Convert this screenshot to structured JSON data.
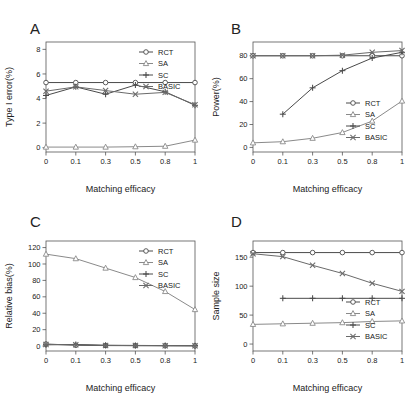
{
  "figure": {
    "background": "#ffffff",
    "width": 413,
    "height": 397,
    "series_colors": {
      "RCT": "#4a4a4a",
      "SA": "#8a8a8a",
      "SC": "#4a4a4a",
      "BASIC": "#6a6a6a"
    }
  },
  "panels": {
    "A": {
      "letter": "A"
    },
    "B": {
      "letter": "B"
    },
    "C": {
      "letter": "C"
    },
    "D": {
      "letter": "D"
    }
  },
  "legend": {
    "entries": [
      {
        "label": "RCT",
        "marker": "circle-icon",
        "color": "#4a4a4a"
      },
      {
        "label": "SA",
        "marker": "triangle-icon",
        "color": "#8a8a8a"
      },
      {
        "label": "SC",
        "marker": "plus-icon",
        "color": "#4a4a4a"
      },
      {
        "label": "BASIC",
        "marker": "cross-icon",
        "color": "#6a6a6a"
      }
    ]
  },
  "chart_data": [
    {
      "type": "line",
      "panel": "A",
      "title": "",
      "xlabel": "Matching efficacy",
      "ylabel": "Type I error(%)",
      "x": [
        0,
        0.1,
        0.3,
        0.5,
        0.8,
        1
      ],
      "xtick_labels": [
        "0",
        "0.1",
        "0.3",
        "0.5",
        "0.8",
        "1"
      ],
      "ytick_labels": [
        "0",
        "2",
        "4",
        "6",
        "8"
      ],
      "yticks": [
        0,
        2,
        4,
        6,
        8
      ],
      "ylim": [
        -0.35,
        8.6
      ],
      "grid": false,
      "legend_position": "top-right",
      "series": [
        {
          "name": "RCT",
          "marker": "circle",
          "values": [
            5.3,
            5.3,
            5.3,
            5.3,
            5.3,
            5.3
          ]
        },
        {
          "name": "SA",
          "marker": "triangle",
          "values": [
            0.05,
            0.05,
            0.05,
            0.08,
            0.12,
            0.62
          ]
        },
        {
          "name": "SC",
          "marker": "plus",
          "values": [
            4.25,
            4.95,
            4.35,
            5.1,
            4.55,
            3.45
          ]
        },
        {
          "name": "BASIC",
          "marker": "cross",
          "values": [
            4.6,
            4.95,
            4.65,
            4.35,
            4.5,
            3.5
          ]
        }
      ]
    },
    {
      "type": "line",
      "panel": "B",
      "title": "",
      "xlabel": "Matching efficacy",
      "ylabel": "Power(%)",
      "x": [
        0,
        0.1,
        0.3,
        0.5,
        0.8,
        1
      ],
      "xtick_labels": [
        "0",
        "0.1",
        "0.3",
        "0.5",
        "0.8",
        "1"
      ],
      "ytick_labels": [
        "0",
        "20",
        "40",
        "60",
        "80"
      ],
      "yticks": [
        0,
        20,
        40,
        60,
        80
      ],
      "ylim": [
        -4,
        92
      ],
      "grid": false,
      "legend_position": "bottom-right",
      "series": [
        {
          "name": "RCT",
          "marker": "circle",
          "values": [
            80,
            80,
            80,
            80,
            80,
            80
          ]
        },
        {
          "name": "SA",
          "marker": "triangle",
          "values": [
            4,
            5,
            8,
            13,
            23,
            40.5
          ]
        },
        {
          "name": "SC",
          "marker": "plus",
          "x": [
            0.1,
            0.3,
            0.5,
            0.8,
            1
          ],
          "values": [
            29,
            52,
            67,
            78,
            83
          ]
        },
        {
          "name": "BASIC",
          "marker": "cross",
          "values": [
            80,
            80,
            80,
            80.5,
            83,
            84.5
          ]
        }
      ]
    },
    {
      "type": "line",
      "panel": "C",
      "title": "",
      "xlabel": "Matching efficacy",
      "ylabel": "Relative bias(%)",
      "x": [
        0,
        0.1,
        0.3,
        0.5,
        0.8,
        1
      ],
      "xtick_labels": [
        "0",
        "0.1",
        "0.3",
        "0.5",
        "0.8",
        "1"
      ],
      "ytick_labels": [
        "0",
        "20",
        "40",
        "60",
        "80",
        "100",
        "120"
      ],
      "yticks": [
        0,
        20,
        40,
        60,
        80,
        100,
        120
      ],
      "ylim": [
        -6,
        128
      ],
      "grid": false,
      "legend_position": "top-right",
      "series": [
        {
          "name": "RCT",
          "marker": "circle",
          "values": [
            2.5,
            1.0,
            0.6,
            0.5,
            0.4,
            0.3
          ]
        },
        {
          "name": "SA",
          "marker": "triangle",
          "values": [
            112,
            106.5,
            95,
            83.5,
            66.5,
            44.5
          ]
        },
        {
          "name": "SC",
          "marker": "plus",
          "values": [
            1.5,
            2.0,
            1.0,
            0.8,
            0.6,
            0.5
          ]
        },
        {
          "name": "BASIC",
          "marker": "cross",
          "values": [
            2.0,
            1.5,
            0.8,
            0.6,
            0.5,
            0.4
          ]
        }
      ]
    },
    {
      "type": "line",
      "panel": "D",
      "title": "",
      "xlabel": "Matching efficacy",
      "ylabel": "Sample size",
      "x": [
        0,
        0.1,
        0.3,
        0.5,
        0.8,
        1
      ],
      "xtick_labels": [
        "0",
        "0.1",
        "0.3",
        "0.5",
        "0.8",
        "1"
      ],
      "ytick_labels": [
        "0",
        "50",
        "100",
        "150"
      ],
      "yticks": [
        0,
        50,
        100,
        150
      ],
      "ylim": [
        -12,
        178
      ],
      "grid": false,
      "legend_position": "bottom-right",
      "series": [
        {
          "name": "RCT",
          "marker": "circle",
          "values": [
            158,
            158,
            158,
            158,
            158,
            158
          ]
        },
        {
          "name": "SA",
          "marker": "triangle",
          "values": [
            34,
            35,
            36,
            37,
            39,
            40
          ]
        },
        {
          "name": "SC",
          "marker": "plus",
          "x": [
            0.1,
            0.3,
            0.5,
            0.8,
            1
          ],
          "values": [
            79,
            79,
            79,
            79,
            79
          ]
        },
        {
          "name": "BASIC",
          "marker": "cross",
          "values": [
            156,
            151,
            136,
            122,
            105,
            91
          ]
        }
      ]
    }
  ]
}
